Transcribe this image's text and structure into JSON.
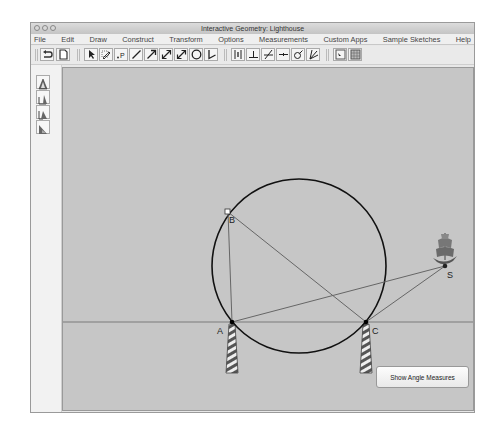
{
  "window": {
    "title": "Interactive Geometry: Lighthouse",
    "traffic_lights": [
      "close",
      "minimize",
      "zoom"
    ]
  },
  "menubar": {
    "items": [
      "File",
      "Edit",
      "Draw",
      "Construct",
      "Transform",
      "Options",
      "Measurements",
      "Custom Apps",
      "Sample Sketches",
      "Help"
    ]
  },
  "toolbar": {
    "groups": [
      [
        "undo-icon",
        "new-document-icon"
      ],
      [
        "select-arrow-icon",
        "pencil-erase-icon",
        "point-icon",
        "segment-icon",
        "ray-icon",
        "line-icon",
        "vector-icon",
        "circle-icon",
        "angle-icon"
      ],
      [
        "perpendicular-bisector-icon",
        "perpendicular-icon",
        "parallel-icon",
        "midpoint-icon",
        "compass-icon",
        "angle-bisector-icon"
      ],
      [
        "zoom-fit-icon",
        "grid-icon"
      ]
    ],
    "point_label": ".P"
  },
  "side_tools": [
    "triangle-tool-icon",
    "angle-tool-1-icon",
    "angle-tool-2-icon",
    "angle-tool-3-icon"
  ],
  "canvas": {
    "points": [
      {
        "label": "A",
        "x": 169,
        "y": 255
      },
      {
        "label": "B",
        "x": 165,
        "y": 145
      },
      {
        "label": "C",
        "x": 303,
        "y": 255
      },
      {
        "label": "S",
        "x": 382,
        "y": 199
      }
    ],
    "circle": {
      "cx": 236,
      "cy": 198,
      "r": 88
    },
    "horizon_y": 255
  },
  "buttons": {
    "show_angle_measures": "Show Angle Measures"
  }
}
